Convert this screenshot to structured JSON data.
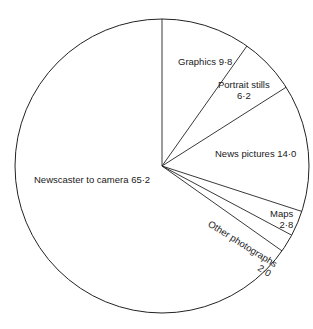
{
  "chart_data": {
    "type": "pie",
    "title": "",
    "start_angle_deg": 0,
    "direction": "clockwise",
    "slices": [
      {
        "label": "Graphics",
        "value": 9.8,
        "value_text": "9·8"
      },
      {
        "label": "Portrait stills",
        "value": 6.2,
        "value_text": "6·2"
      },
      {
        "label": "News pictures",
        "value": 14.0,
        "value_text": "14·0"
      },
      {
        "label": "Maps",
        "value": 2.8,
        "value_text": "2·8"
      },
      {
        "label": "Other photographs",
        "value": 2.0,
        "value_text": "2·0"
      },
      {
        "label": "Newscaster to camera",
        "value": 65.2,
        "value_text": "65·2"
      }
    ],
    "total": 100.0,
    "legend": "none",
    "fill": "#ffffff",
    "stroke": "#222222"
  },
  "labels": {
    "graphics": "Graphics 9·8",
    "portrait_line1": "Portrait stills",
    "portrait_line2": "6·2",
    "news": "News pictures 14·0",
    "maps_line1": "Maps",
    "maps_line2": "2·8",
    "other_line1": "Other photographs",
    "other_line2": "2·0",
    "newscaster": "Newscaster to camera 65·2"
  }
}
